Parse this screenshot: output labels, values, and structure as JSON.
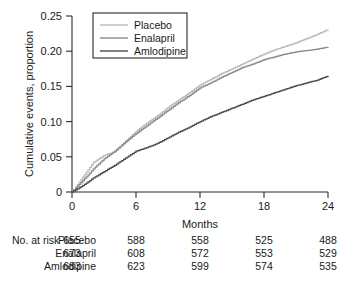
{
  "chart_data": {
    "type": "line",
    "title": "",
    "xlabel": "Months",
    "ylabel": "Cumulative events, proportion",
    "xlim": [
      0,
      24
    ],
    "ylim": [
      0,
      0.25
    ],
    "xticks": [
      "0",
      "6",
      "12",
      "18",
      "24"
    ],
    "xtick_values": [
      0,
      6,
      12,
      18,
      24
    ],
    "yticks": [
      "0",
      "0.05",
      "0.10",
      "0.15",
      "0.20",
      "0.25"
    ],
    "ytick_values": [
      0,
      0.05,
      0.1,
      0.15,
      0.2,
      0.25
    ],
    "grid": false,
    "legend_position": "top-left-inside",
    "x": [
      0,
      1,
      2,
      3,
      4,
      5,
      6,
      7,
      8,
      9,
      10,
      11,
      12,
      13,
      14,
      15,
      16,
      17,
      18,
      19,
      20,
      21,
      22,
      23,
      24
    ],
    "series": [
      {
        "name": "Placebo",
        "color": "#b9b9b9",
        "values": [
          0.0,
          0.021,
          0.042,
          0.052,
          0.057,
          0.072,
          0.086,
          0.098,
          0.108,
          0.12,
          0.131,
          0.141,
          0.152,
          0.16,
          0.168,
          0.175,
          0.182,
          0.189,
          0.196,
          0.202,
          0.207,
          0.212,
          0.218,
          0.224,
          0.231
        ]
      },
      {
        "name": "Enalapril",
        "color": "#8a8a8a",
        "values": [
          0.0,
          0.016,
          0.033,
          0.047,
          0.058,
          0.071,
          0.083,
          0.094,
          0.105,
          0.116,
          0.127,
          0.137,
          0.148,
          0.155,
          0.163,
          0.17,
          0.177,
          0.182,
          0.188,
          0.192,
          0.196,
          0.199,
          0.201,
          0.203,
          0.206
        ]
      },
      {
        "name": "Amlodipine",
        "color": "#4a4a4a",
        "values": [
          0.0,
          0.009,
          0.02,
          0.029,
          0.038,
          0.048,
          0.058,
          0.063,
          0.069,
          0.077,
          0.085,
          0.092,
          0.1,
          0.107,
          0.113,
          0.119,
          0.125,
          0.131,
          0.136,
          0.141,
          0.146,
          0.151,
          0.155,
          0.159,
          0.165
        ]
      }
    ]
  },
  "legend": {
    "items": [
      {
        "label": "Placebo",
        "color": "#b9b9b9"
      },
      {
        "label": "Enalapril",
        "color": "#8a8a8a"
      },
      {
        "label": "Amlodipine",
        "color": "#4a4a4a"
      }
    ]
  },
  "risk_table": {
    "title": "No. at risk",
    "columns": [
      "0",
      "6",
      "12",
      "18",
      "24"
    ],
    "rows": [
      {
        "name": "Placebo",
        "values": [
          "655",
          "588",
          "558",
          "525",
          "488"
        ]
      },
      {
        "name": "Enalapril",
        "values": [
          "673",
          "608",
          "572",
          "553",
          "529"
        ]
      },
      {
        "name": "Amlodipine",
        "values": [
          "683",
          "623",
          "599",
          "574",
          "535"
        ]
      }
    ]
  }
}
